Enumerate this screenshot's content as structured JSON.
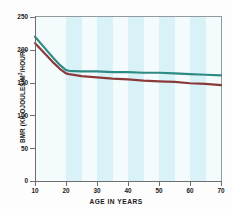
{
  "chart_data": {
    "type": "line",
    "title": "",
    "xlabel": "AGE IN YEARS",
    "ylabel": "BMR (KILOJOULES/M2/HOUR)",
    "ylabel_prefix": "BMR (KILOJOULES/M",
    "ylabel_sup": "2",
    "ylabel_suffix": "/HOUR)",
    "xlim": [
      10,
      70
    ],
    "ylim": [
      0,
      250
    ],
    "xticks": [
      10,
      20,
      30,
      40,
      50,
      60,
      70
    ],
    "xtick_labels": [
      "10",
      "20",
      "30",
      "40",
      "50",
      "60",
      "70"
    ],
    "yticks": [
      0,
      50,
      100,
      150,
      200,
      250
    ],
    "ytick_labels": [
      "0",
      "50",
      "100",
      "150",
      "200",
      "250"
    ],
    "grid": false,
    "legend": "none",
    "plot_background": "#f3fbfd",
    "band_color": "#d8f2f8",
    "band_ranges": [
      [
        20,
        25
      ],
      [
        30,
        35
      ],
      [
        40,
        45
      ],
      [
        50,
        55
      ],
      [
        60,
        65
      ]
    ],
    "series": [
      {
        "name": "male",
        "color": "#2e8b84",
        "x": [
          10,
          12,
          14,
          16,
          18,
          20,
          21,
          25,
          30,
          35,
          40,
          45,
          50,
          55,
          60,
          65,
          70
        ],
        "values": [
          220,
          209,
          198,
          187,
          177,
          169,
          168,
          167,
          167,
          166,
          166,
          165,
          165,
          164,
          163,
          162,
          161
        ]
      },
      {
        "name": "female",
        "color": "#8b3a3a",
        "x": [
          10,
          12,
          14,
          16,
          18,
          20,
          21,
          25,
          30,
          35,
          40,
          45,
          50,
          55,
          60,
          65,
          70
        ],
        "values": [
          210,
          200,
          190,
          180,
          171,
          164,
          163,
          160,
          158,
          156,
          155,
          153,
          152,
          151,
          149,
          148,
          146
        ]
      }
    ]
  }
}
